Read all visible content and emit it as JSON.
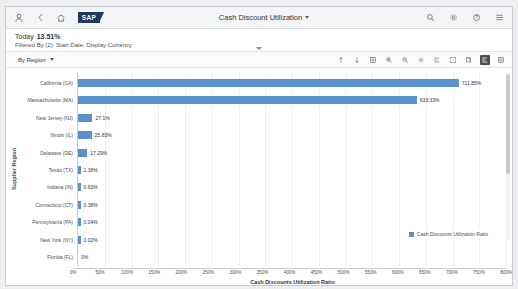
{
  "shellbar": {
    "title": "Cash Discount Utilization",
    "logo_text": "SAP",
    "icons": {
      "user": "user-icon",
      "back": "back-icon",
      "home": "home-icon",
      "search": "search-icon",
      "settings": "gear-icon",
      "help": "help-icon",
      "menu": "hamburger-menu-icon"
    }
  },
  "kpi": {
    "label": "Today",
    "value": "13.51%",
    "filter_text": "Filtered By (2): Start Date, Display Currency"
  },
  "toolbar": {
    "dimension_label": "By Region",
    "icons": [
      "sort-ascending-icon",
      "sort-descending-icon",
      "table-view-icon",
      "zoom-in-icon",
      "zoom-out-icon",
      "settings-icon",
      "chart-legend-icon",
      "fullscreen-icon",
      "copy-icon",
      "bar-chart-icon",
      "grid-icon"
    ],
    "active_icon": "bar-chart-icon"
  },
  "chart_data": {
    "type": "bar",
    "orientation": "horizontal",
    "title": "",
    "xlabel": "Cash Discounts Utilization Ratio",
    "ylabel": "Supplier Region",
    "legend": [
      "Cash Discounts Utilization Ratio"
    ],
    "legend_position": "bottom-right",
    "grid": true,
    "xlim": [
      0,
      800
    ],
    "xticks": [
      "0%",
      "50%",
      "100%",
      "150%",
      "200%",
      "250%",
      "300%",
      "350%",
      "400%",
      "450%",
      "500%",
      "550%",
      "600%",
      "650%",
      "700%",
      "750%",
      "800%"
    ],
    "xtick_values": [
      0,
      50,
      100,
      150,
      200,
      250,
      300,
      350,
      400,
      450,
      500,
      550,
      600,
      650,
      700,
      750,
      800
    ],
    "categories": [
      "California (CA)",
      "Massachusetts (MA)",
      "New Jersey (NJ)",
      "Illinois (IL)",
      "Delaware (DE)",
      "Texas (TX)",
      "Indiana (IN)",
      "Connecticut (CT)",
      "Pennsylvania (PA)",
      "New York (NY)",
      "Florida (FL)"
    ],
    "values": [
      711.85,
      633.33,
      27.1,
      25.83,
      17.29,
      1.38,
      0.63,
      0.38,
      0.04,
      0.02,
      0
    ],
    "data_labels": [
      "711.85%",
      "633.33%",
      "27.1%",
      "25.83%",
      "17.29%",
      "1.38%",
      "0.63%",
      "0.38%",
      "0.04%",
      "0.02%",
      "0%"
    ],
    "series_color": "#5b91c6"
  }
}
